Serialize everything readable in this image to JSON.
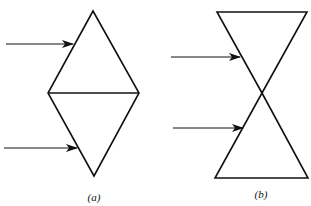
{
  "figure": {
    "panels": [
      {
        "id": "a",
        "label": "(a)",
        "shape": "diamond made of two triangles sharing a horizontal base",
        "vertices": {
          "top": [
            93,
            11
          ],
          "left": [
            48,
            93
          ],
          "right": [
            139,
            93
          ],
          "bottom": [
            94,
            176
          ]
        },
        "arrows": [
          {
            "from": [
              6,
              44
            ],
            "to": [
              73,
              44
            ]
          },
          {
            "from": [
              4,
              148
            ],
            "to": [
              77,
              148
            ]
          }
        ]
      },
      {
        "id": "b",
        "label": "(b)",
        "shape": "hourglass made of two triangles meeting at apex",
        "vertices": {
          "top_left": [
            217,
            12
          ],
          "top_right": [
            307,
            12
          ],
          "center": [
            262,
            93
          ],
          "bottom_left": [
            215,
            178
          ],
          "bottom_right": [
            308,
            178
          ]
        },
        "arrows": [
          {
            "from": [
              171,
              57
            ],
            "to": [
              240,
              57
            ]
          },
          {
            "from": [
              173,
              128
            ],
            "to": [
              243,
              128
            ]
          }
        ]
      }
    ],
    "colors": {
      "stroke": "#111111",
      "background": "#ffffff"
    }
  }
}
